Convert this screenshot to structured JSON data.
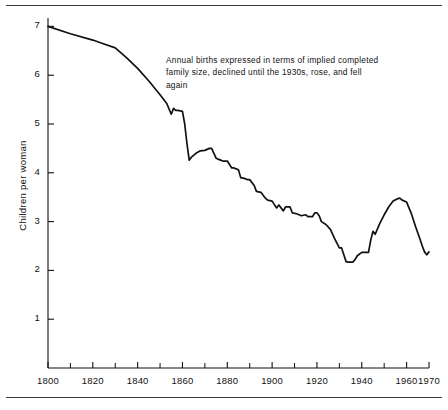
{
  "figure": {
    "annotation_lines": [
      "Annual births expressed in terms of implied completed",
      "family size,  declined until the 1930s, rose,  and fell",
      "again"
    ],
    "frame_color": "#3a3a3a",
    "line_color": "#111111",
    "background": "#ffffff"
  },
  "chart_data": {
    "type": "line",
    "title": "",
    "subtitle": "",
    "xlabel": "",
    "ylabel": "Children per woman",
    "xlim": [
      1800,
      1970
    ],
    "ylim": [
      0,
      7.35
    ],
    "grid": false,
    "legend": null,
    "annotations": [
      {
        "text": "Annual births expressed in terms of implied completed family size,  declined until the 1930s, rose,  and fell again",
        "x": 1846,
        "y": 6.2
      }
    ],
    "x_major_ticks": [
      1800,
      1820,
      1840,
      1860,
      1880,
      1900,
      1920,
      1940,
      1960,
      1970
    ],
    "x_tick_labels": [
      "1800",
      "1820",
      "1840",
      "1860",
      "1880",
      "1900",
      "1920",
      "1940",
      "1960",
      "1970"
    ],
    "x_minor_ticks": [
      1810,
      1830,
      1850,
      1870,
      1890,
      1910,
      1930,
      1950
    ],
    "y_major_ticks": [
      1,
      2,
      3,
      4,
      5,
      6,
      7
    ],
    "y_tick_labels": [
      "1",
      "2",
      "3",
      "4",
      "5",
      "6",
      "7"
    ],
    "series": [
      {
        "name": "Children per woman",
        "x": [
          1800,
          1810,
          1820,
          1825,
          1830,
          1835,
          1840,
          1845,
          1850,
          1853,
          1855,
          1856,
          1857,
          1858,
          1860,
          1861,
          1862,
          1863,
          1864,
          1866,
          1868,
          1870,
          1872,
          1873,
          1875,
          1877,
          1878,
          1880,
          1882,
          1883,
          1885,
          1886,
          1888,
          1889,
          1890,
          1892,
          1893,
          1895,
          1897,
          1898,
          1900,
          1902,
          1903,
          1905,
          1906,
          1908,
          1909,
          1911,
          1913,
          1915,
          1916,
          1918,
          1919,
          1920,
          1921,
          1922,
          1924,
          1926,
          1928,
          1930,
          1931,
          1932,
          1933,
          1934,
          1936,
          1937,
          1938,
          1940,
          1941,
          1942,
          1943,
          1944,
          1945,
          1946,
          1948,
          1950,
          1952,
          1954,
          1956,
          1957,
          1958,
          1960,
          1962,
          1964,
          1966,
          1967,
          1968,
          1969,
          1970
        ],
        "y": [
          7.0,
          6.85,
          6.72,
          6.64,
          6.56,
          6.36,
          6.14,
          5.88,
          5.6,
          5.42,
          5.2,
          5.32,
          5.28,
          5.28,
          5.26,
          5.0,
          4.6,
          4.26,
          4.32,
          4.4,
          4.45,
          4.46,
          4.5,
          4.5,
          4.3,
          4.26,
          4.24,
          4.24,
          4.1,
          4.1,
          4.06,
          3.9,
          3.88,
          3.86,
          3.86,
          3.74,
          3.62,
          3.6,
          3.48,
          3.44,
          3.42,
          3.28,
          3.34,
          3.22,
          3.3,
          3.3,
          3.18,
          3.16,
          3.12,
          3.14,
          3.1,
          3.1,
          3.18,
          3.18,
          3.12,
          3.0,
          2.94,
          2.84,
          2.64,
          2.46,
          2.46,
          2.32,
          2.18,
          2.17,
          2.17,
          2.22,
          2.3,
          2.37,
          2.37,
          2.37,
          2.37,
          2.62,
          2.8,
          2.74,
          2.96,
          3.14,
          3.3,
          3.42,
          3.47,
          3.48,
          3.44,
          3.4,
          3.18,
          2.9,
          2.64,
          2.5,
          2.38,
          2.32,
          2.38
        ]
      }
    ]
  }
}
